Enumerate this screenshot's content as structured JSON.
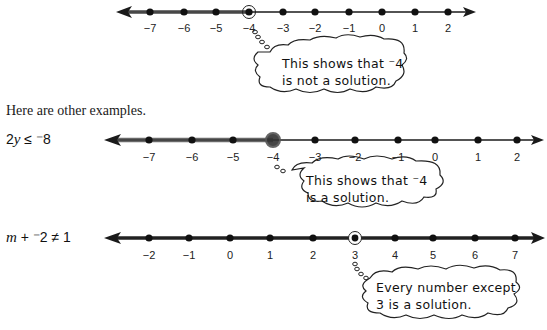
{
  "intro_text": "Here are other examples.",
  "number_lines": [
    {
      "id": "line1",
      "equation": "",
      "ticks": [
        "−7",
        "−6",
        "−5",
        "−4",
        "−3",
        "−2",
        "−1",
        "0",
        "1",
        "2"
      ],
      "tick_x": [
        150,
        184,
        216,
        249,
        283,
        315,
        349,
        382,
        415,
        448
      ],
      "highlighted_point": "−4",
      "point_style": "open-circle",
      "shaded_direction": "left",
      "callout": {
        "line1": "This shows that ⁻4",
        "line2": "is not a solution."
      }
    },
    {
      "id": "line2",
      "equation_parts": {
        "coef": "2",
        "var": "y",
        "rel": " ≤ ",
        "rhs": "⁻8"
      },
      "ticks": [
        "−7",
        "−6",
        "−5",
        "−4",
        "−3",
        "−2",
        "−1",
        "0",
        "1",
        "2"
      ],
      "tick_x": [
        149,
        192,
        233,
        273,
        315,
        355,
        398,
        435,
        478,
        517
      ],
      "highlighted_point": "−4",
      "point_style": "closed-circle",
      "shaded_direction": "left",
      "callout": {
        "line1": "This shows that ⁻4",
        "line2": "is a solution."
      }
    },
    {
      "id": "line3",
      "equation_parts": {
        "var": "m",
        "rest": " + ⁻2 ≠ 1"
      },
      "ticks": [
        "−2",
        "−1",
        "0",
        "1",
        "2",
        "3",
        "4",
        "5",
        "6",
        "7"
      ],
      "tick_x": [
        149,
        189,
        230,
        270,
        313,
        355,
        395,
        433,
        475,
        515
      ],
      "highlighted_point": "3",
      "point_style": "open-circle",
      "shaded_direction": "all-except-point",
      "callout": {
        "line1": "Every number except",
        "line2": "3 is a solution."
      }
    }
  ],
  "colors": {
    "line": "#1a1a1a",
    "shade": "#555555",
    "text": "#1a1a1a"
  }
}
